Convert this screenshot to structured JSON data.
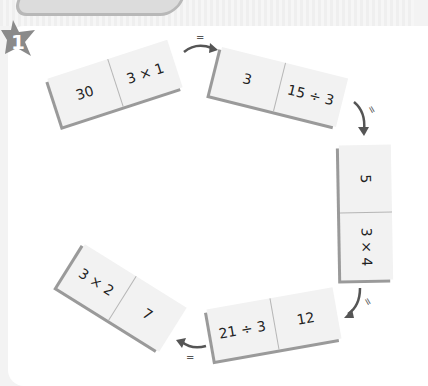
{
  "exercise": {
    "number": "1",
    "badge_shape": "star",
    "colors": {
      "panel": "#ffffff",
      "background": "#f3f3f3",
      "domino_face": "#f2f2f2",
      "domino_shadow": "#9a9a9a",
      "star": "#8a8a8a",
      "arrow": "#555555"
    }
  },
  "dominoes": [
    {
      "left": "30",
      "right": "3 × 1"
    },
    {
      "left": "3",
      "right": "15 ÷ 3"
    },
    {
      "left": "5",
      "right": "3 × 4"
    },
    {
      "left": "21 ÷ 3",
      "right": "12"
    },
    {
      "left": "3 × 2",
      "right": "7"
    }
  ],
  "connectors": [
    {
      "label": "="
    },
    {
      "label": "="
    },
    {
      "label": "="
    },
    {
      "label": "="
    }
  ]
}
